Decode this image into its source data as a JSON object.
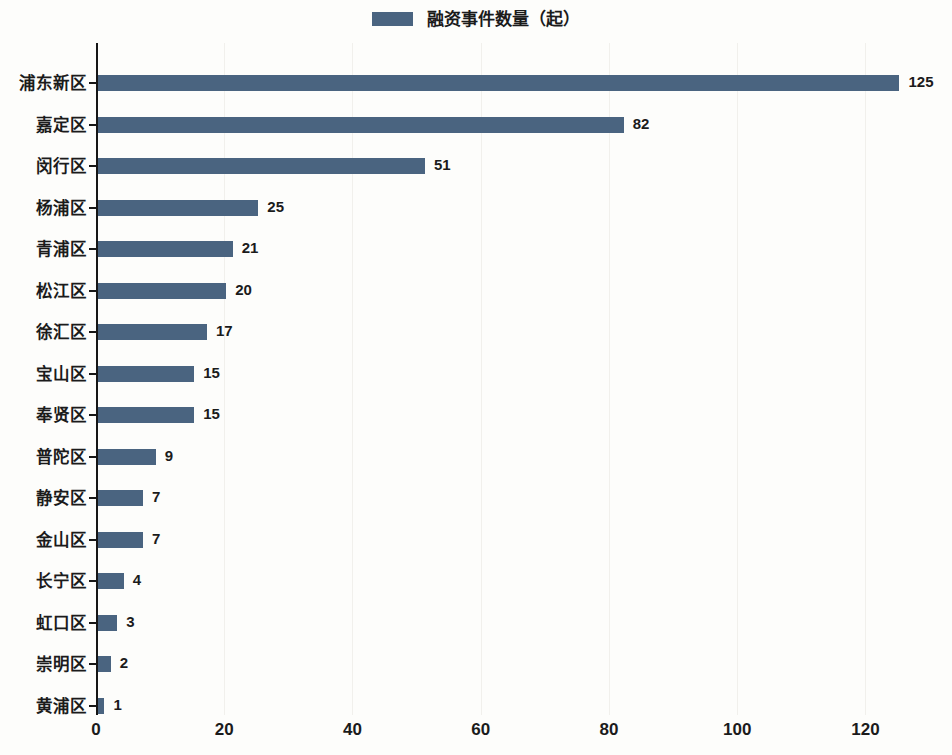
{
  "chart_data": {
    "type": "bar",
    "orientation": "horizontal",
    "title": "",
    "subtitle": "",
    "xlabel": "",
    "ylabel": "",
    "legend": [
      {
        "name": "融资事件数量（起）",
        "color": "#4a6480",
        "swatch": "legend-color-swatch"
      }
    ],
    "legend_position": "top-center",
    "grid": true,
    "grid_axis": "x",
    "xlim": [
      0,
      133.5
    ],
    "xticks": [
      0,
      20,
      40,
      60,
      80,
      100,
      120
    ],
    "xticklabels": [
      "0",
      "20",
      "40",
      "60",
      "80",
      "100",
      "120"
    ],
    "categories": [
      "浦东新区",
      "嘉定区",
      "闵行区",
      "杨浦区",
      "青浦区",
      "松江区",
      "徐汇区",
      "宝山区",
      "奉贤区",
      "普陀区",
      "静安区",
      "金山区",
      "长宁区",
      "虹口区",
      "崇明区",
      "黄浦区"
    ],
    "values": [
      125,
      82,
      51,
      25,
      21,
      20,
      17,
      15,
      15,
      9,
      7,
      7,
      4,
      3,
      2,
      1
    ],
    "value_labels": [
      "125",
      "82",
      "51",
      "25",
      "21",
      "20",
      "17",
      "15",
      "15",
      "9",
      "7",
      "7",
      "4",
      "3",
      "2",
      "1"
    ],
    "series": [
      {
        "name": "融资事件数量（起）",
        "color": "#4a6480",
        "values": [
          125,
          82,
          51,
          25,
          21,
          20,
          17,
          15,
          15,
          9,
          7,
          7,
          4,
          3,
          2,
          1
        ]
      }
    ],
    "colors": {
      "bar": "#4a6480",
      "axis": "#161616",
      "grid": "#f1f0ec",
      "text": "#1b1b1b",
      "background": "#fdfdfb"
    }
  }
}
